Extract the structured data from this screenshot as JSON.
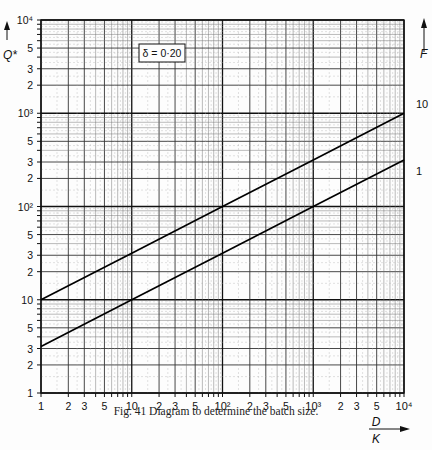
{
  "chart_data": {
    "type": "line",
    "title": "Fig. 41  Diagram to determine the batch size.",
    "xlabel": "D/K",
    "ylabel": "Q*",
    "right_label": "F",
    "xscale": "log",
    "yscale": "log",
    "xlim": [
      1,
      10000
    ],
    "ylim": [
      1,
      10000
    ],
    "grid": true,
    "annotation": "δ = 0·20",
    "x_tick_labels": [
      "1",
      "2",
      "3",
      "5",
      "10",
      "2",
      "3",
      "5",
      "10²",
      "2",
      "3",
      "5",
      "10³",
      "2",
      "3",
      "5",
      "10⁴"
    ],
    "y_tick_labels": [
      "1",
      "2",
      "3",
      "5",
      "10",
      "2",
      "3",
      "5",
      "10²",
      "2",
      "3",
      "5",
      "10³",
      "2",
      "3",
      "5",
      "10⁴"
    ],
    "series": [
      {
        "name": "10",
        "x": [
          1,
          10,
          100,
          1000,
          10000
        ],
        "values": [
          10,
          31.6,
          100,
          316,
          1000
        ]
      },
      {
        "name": "1",
        "x": [
          1,
          10,
          100,
          1000,
          10000
        ],
        "values": [
          3.16,
          10,
          31.6,
          100,
          316
        ]
      }
    ]
  },
  "labels": {
    "y_axis": "Q*",
    "f_axis": "F",
    "x_num": "D",
    "x_den": "K",
    "delta_box": "δ = 0·20",
    "caption": "Fig. 41  Diagram to determine the batch size."
  }
}
